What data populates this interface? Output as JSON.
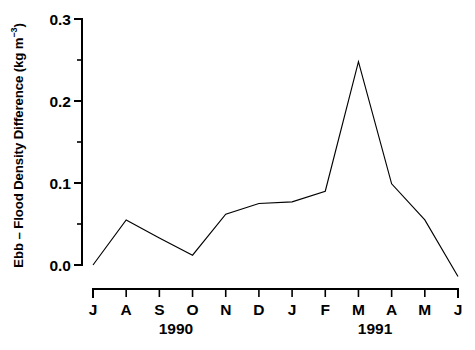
{
  "chart_data": {
    "type": "line",
    "title": "",
    "subtitle": "",
    "xlabel": "",
    "ylabel_prefix": "Ebb – Flood Density Difference (kg m",
    "ylabel_superscript": "−3",
    "ylabel_suffix": ")",
    "ylabel_full": "Ebb – Flood Density Difference (kg m⁻³)",
    "grid": false,
    "legend": "none",
    "ylim": [
      -0.02,
      0.3
    ],
    "ytick_values": [
      0.0,
      0.1,
      0.2,
      0.3
    ],
    "ytick_labels": [
      "0.0",
      "0.1",
      "0.2",
      "0.3"
    ],
    "yminor_tick_values": [
      0.05,
      0.15,
      0.25
    ],
    "categories": [
      "J",
      "A",
      "S",
      "O",
      "N",
      "D",
      "J",
      "F",
      "M",
      "A",
      "M",
      "J"
    ],
    "x_group_labels": [
      {
        "label": "1990",
        "center_category_index": 2
      },
      {
        "label": "1991",
        "center_category_index": 8
      }
    ],
    "series": [
      {
        "name": "Ebb – Flood Density Difference",
        "color": "#000000",
        "values": [
          0.0,
          0.055,
          0.033,
          0.012,
          0.062,
          0.075,
          0.077,
          0.09,
          0.248,
          0.099,
          0.055,
          -0.014
        ]
      }
    ],
    "points": [
      {
        "x": "J",
        "year": "1990",
        "y": 0.0
      },
      {
        "x": "A",
        "year": "1990",
        "y": 0.055
      },
      {
        "x": "S",
        "year": "1990",
        "y": 0.033
      },
      {
        "x": "O",
        "year": "1990",
        "y": 0.012
      },
      {
        "x": "N",
        "year": "1990",
        "y": 0.062
      },
      {
        "x": "D",
        "year": "1990",
        "y": 0.075
      },
      {
        "x": "J",
        "year": "1991",
        "y": 0.077
      },
      {
        "x": "F",
        "year": "1991",
        "y": 0.09
      },
      {
        "x": "M",
        "year": "1991",
        "y": 0.248
      },
      {
        "x": "A",
        "year": "1991",
        "y": 0.099
      },
      {
        "x": "M",
        "year": "1991",
        "y": 0.055
      },
      {
        "x": "J",
        "year": "1991",
        "y": -0.014
      }
    ]
  }
}
